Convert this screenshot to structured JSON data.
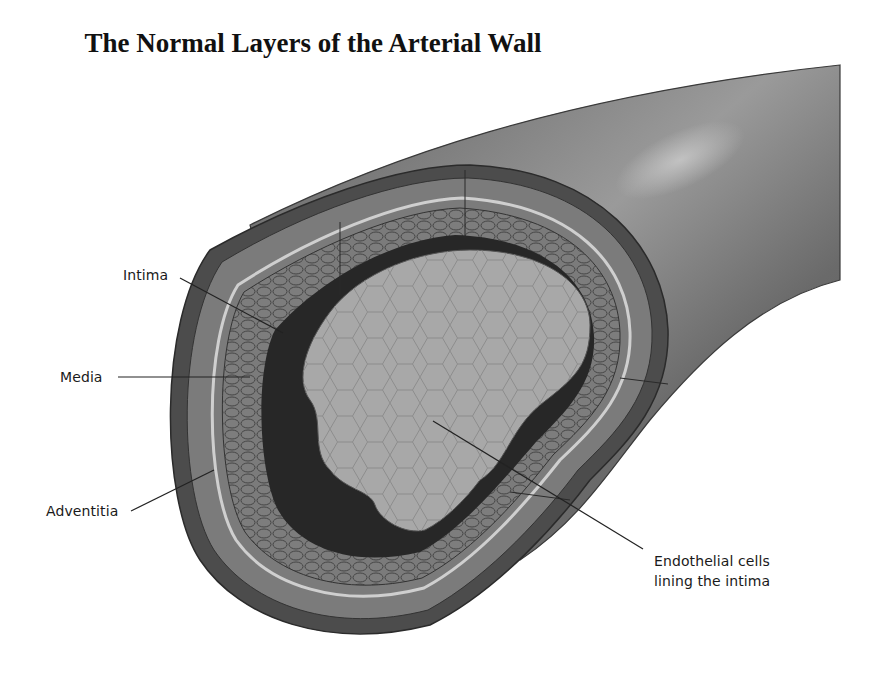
{
  "title": "The Normal Layers of the Arterial Wall",
  "labels": {
    "intima": "Intima",
    "media": "Media",
    "adventitia": "Adventitia",
    "endothelial_line1": "Endothelial cells",
    "endothelial_line2": "lining the intima"
  },
  "colors": {
    "vessel_outer": "#6e6e6e",
    "adventitia": "#7a7a7a",
    "media": "#8a8a8a",
    "elastic_lamina": "#c8c8c8",
    "intima": "#2a2a2a",
    "lumen": "#a9a9a9",
    "leader_line": "#222222"
  }
}
